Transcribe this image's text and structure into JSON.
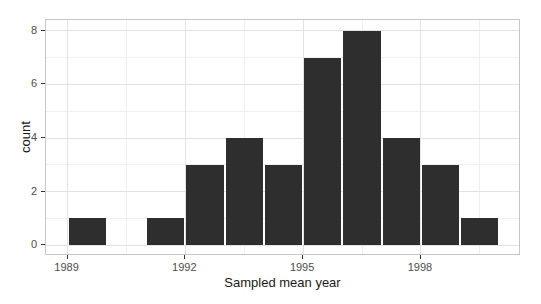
{
  "chart_data": {
    "type": "bar",
    "subtype": "histogram",
    "xlabel": "Sampled mean year",
    "ylabel": "count",
    "bin_width": 1,
    "bin_starts": [
      1989,
      1990,
      1991,
      1992,
      1993,
      1994,
      1995,
      1996,
      1997,
      1998,
      1999
    ],
    "values": [
      1,
      0,
      1,
      3,
      4,
      3,
      7,
      8,
      4,
      3,
      1
    ],
    "x_major_ticks": [
      1989,
      1992,
      1995,
      1998
    ],
    "x_minor_gridlines": [
      1990.5,
      1993.5,
      1996.5,
      1999.5
    ],
    "y_major_ticks": [
      0,
      2,
      4,
      6,
      8
    ],
    "y_minor_gridlines": [
      1,
      3,
      5,
      7
    ],
    "xlim": [
      1988.45,
      2000.55
    ],
    "ylim": [
      -0.4,
      8.4
    ],
    "grid": true,
    "legend": "none",
    "bar_color": "#2e2e2e",
    "bar_gap_color": "#ffffff",
    "colors": {
      "background": "#ffffff",
      "panel_background": "#ffffff",
      "panel_border": "#c6c6c6",
      "grid_major": "#e2e2e2",
      "grid_minor": "#efefef",
      "tick_mark": "#333333",
      "tick_label": "#4d4d4d",
      "axis_title": "#1a1a1a"
    }
  }
}
